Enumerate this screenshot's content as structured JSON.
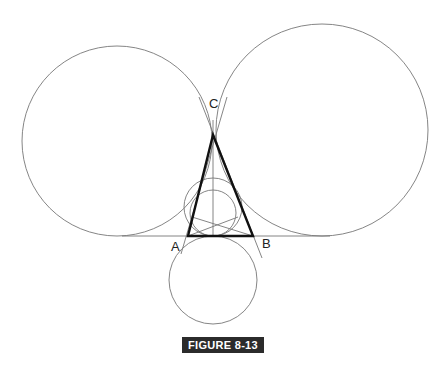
{
  "figure": {
    "caption": "FIGURE 8-13",
    "labels": {
      "A": "A",
      "B": "B",
      "C": "C"
    }
  },
  "geometry": {
    "triangle": {
      "A": [
        188,
        236
      ],
      "B": [
        253,
        236
      ],
      "C": [
        213,
        135
      ]
    },
    "baseline": {
      "x1": 122,
      "x2": 330,
      "y": 236
    },
    "circles": [
      {
        "name": "left-excircle",
        "cx": 117,
        "cy": 141,
        "r": 95
      },
      {
        "name": "right-excircle",
        "cx": 322,
        "cy": 130,
        "r": 106
      },
      {
        "name": "bottom-excircle",
        "cx": 213,
        "cy": 280,
        "r": 44
      },
      {
        "name": "incircle",
        "cx": 213,
        "cy": 213,
        "r": 23
      },
      {
        "name": "outer-circle",
        "cx": 213,
        "cy": 207,
        "r": 29
      }
    ]
  },
  "colors": {
    "stroke_thin": "#777777",
    "stroke_thick": "#111111",
    "caption_bg": "#2b2b2b"
  }
}
